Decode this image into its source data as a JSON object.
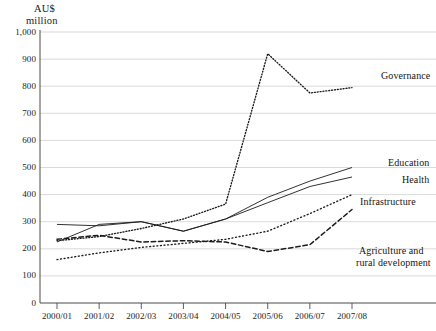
{
  "axis": {
    "unit_line1": "AU$",
    "unit_line2": "million"
  },
  "chart_data": {
    "type": "line",
    "title": "",
    "subtitle": "",
    "xlabel": "",
    "ylabel": "AU$ million",
    "ylim": [
      0,
      1000
    ],
    "ytick_labels": [
      "0",
      "100",
      "200",
      "300",
      "400",
      "500",
      "600",
      "700",
      "800",
      "900",
      "1,000"
    ],
    "ytick_values": [
      0,
      100,
      200,
      300,
      400,
      500,
      600,
      700,
      800,
      900,
      1000
    ],
    "grid": true,
    "grid_axis": "y",
    "legend_position": "right-inline",
    "categories": [
      "2000/01",
      "2001/02",
      "2002/03",
      "2003/04",
      "2004/05",
      "2005/06",
      "2006/07",
      "2007/08"
    ],
    "series": [
      {
        "name": "Governance",
        "style": "fine-dotted",
        "color": "#1b1b1b",
        "values": [
          230,
          245,
          275,
          310,
          365,
          920,
          775,
          795
        ]
      },
      {
        "name": "Education",
        "style": "solid",
        "color": "#1b1b1b",
        "values": [
          225,
          290,
          300,
          265,
          310,
          390,
          450,
          500
        ]
      },
      {
        "name": "Health",
        "style": "solid",
        "color": "#1b1b1b",
        "values": [
          290,
          285,
          300,
          265,
          310,
          370,
          430,
          465
        ]
      },
      {
        "name": "Infrastructure",
        "style": "dotted",
        "color": "#1b1b1b",
        "values": [
          160,
          185,
          205,
          220,
          235,
          265,
          330,
          400
        ]
      },
      {
        "name": "Agriculture and rural development",
        "style": "dashed",
        "color": "#1b1b1b",
        "values": [
          235,
          250,
          225,
          230,
          225,
          190,
          215,
          345
        ]
      }
    ]
  },
  "labels": {
    "governance": "Governance",
    "education": "Education",
    "health": "Health",
    "infrastructure": "Infrastructure",
    "agriculture_l1": "Agriculture and",
    "agriculture_l2": "rural development"
  }
}
